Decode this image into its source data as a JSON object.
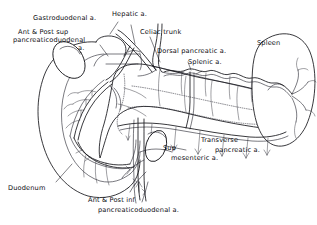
{
  "figure": {
    "type": "anatomical-line-drawing",
    "style": "black ink line drawing on white background, handwritten-style labels"
  },
  "labels": {
    "gastroduodenal": "Gastroduodenal a.",
    "ant_post_sup_line1": "Ant & Post sup",
    "ant_post_sup_line2": "pancreaticoduodenal",
    "ant_post_sup_line3": "a.",
    "hepatic": "Hepatic a.",
    "celiac_trunk": "Celiac trunk",
    "dorsal_pancreatic": "Dorsal pancreatic a.",
    "splenic": "Splenic a.",
    "spleen": "Spleen",
    "transverse_line1": "Transverse",
    "transverse_line2": "pancreatic a.",
    "sup_mesenteric_line1": "Sup",
    "sup_mesenteric_line2": "mesenteric a.",
    "duodenum": "Duodenum",
    "ant_post_inf_line1": "Ant & Post inf",
    "ant_post_inf_line2": "pancreaticoduodenal  a."
  },
  "structures": {
    "organs": [
      "duodenum",
      "pancreas",
      "spleen"
    ],
    "arteries": [
      "Celiac trunk",
      "Hepatic a.",
      "Gastroduodenal a.",
      "Ant & Post sup pancreaticoduodenal a.",
      "Ant & Post inf pancreaticoduodenal a.",
      "Splenic a.",
      "Dorsal pancreatic a.",
      "Transverse pancreatic a.",
      "Sup mesenteric a."
    ]
  },
  "colors": {
    "ink": "#15151a",
    "background": "#ffffff",
    "text": "#0d0d12"
  }
}
